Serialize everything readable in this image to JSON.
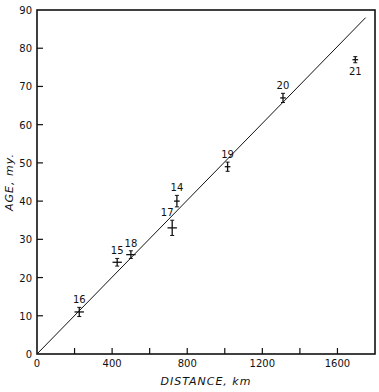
{
  "chart_data": {
    "type": "scatter",
    "title": "",
    "xlabel": "DISTANCE, km",
    "ylabel": "AGE, my.",
    "xlim": [
      0,
      1800
    ],
    "ylim": [
      0,
      90
    ],
    "grid": false,
    "x_ticks": [
      0,
      200,
      400,
      600,
      800,
      1000,
      1200,
      1400,
      1600
    ],
    "x_tick_labels": [
      "0",
      "",
      "400",
      "",
      "800",
      "",
      "1200",
      "",
      "1600"
    ],
    "y_ticks": [
      0,
      10,
      20,
      30,
      40,
      50,
      60,
      70,
      80,
      90
    ],
    "y_tick_labels": [
      "0",
      "10",
      "20",
      "30",
      "40",
      "50",
      "60",
      "70",
      "80",
      "90"
    ],
    "series": [
      {
        "name": "samples",
        "points": [
          {
            "label": "16",
            "x": 225,
            "y": 11,
            "yerr": 1.2,
            "xerr": 25
          },
          {
            "label": "15",
            "x": 427,
            "y": 24,
            "yerr": 1,
            "xerr": 25
          },
          {
            "label": "18",
            "x": 500,
            "y": 26,
            "yerr": 1,
            "xerr": 25
          },
          {
            "label": "17",
            "x": 720,
            "y": 33,
            "yerr": 2,
            "xerr": 25
          },
          {
            "label": "14",
            "x": 745,
            "y": 40,
            "yerr": 1.5,
            "xerr": 15
          },
          {
            "label": "19",
            "x": 1015,
            "y": 49,
            "yerr": 1.2,
            "xerr": 15
          },
          {
            "label": "20",
            "x": 1310,
            "y": 67,
            "yerr": 1.2,
            "xerr": 15
          },
          {
            "label": "21",
            "x": 1695,
            "y": 77,
            "yerr": 0.8,
            "xerr": 15
          }
        ]
      },
      {
        "name": "fit-line",
        "type": "line",
        "x": [
          0,
          1750
        ],
        "y": [
          0,
          88
        ]
      }
    ]
  }
}
